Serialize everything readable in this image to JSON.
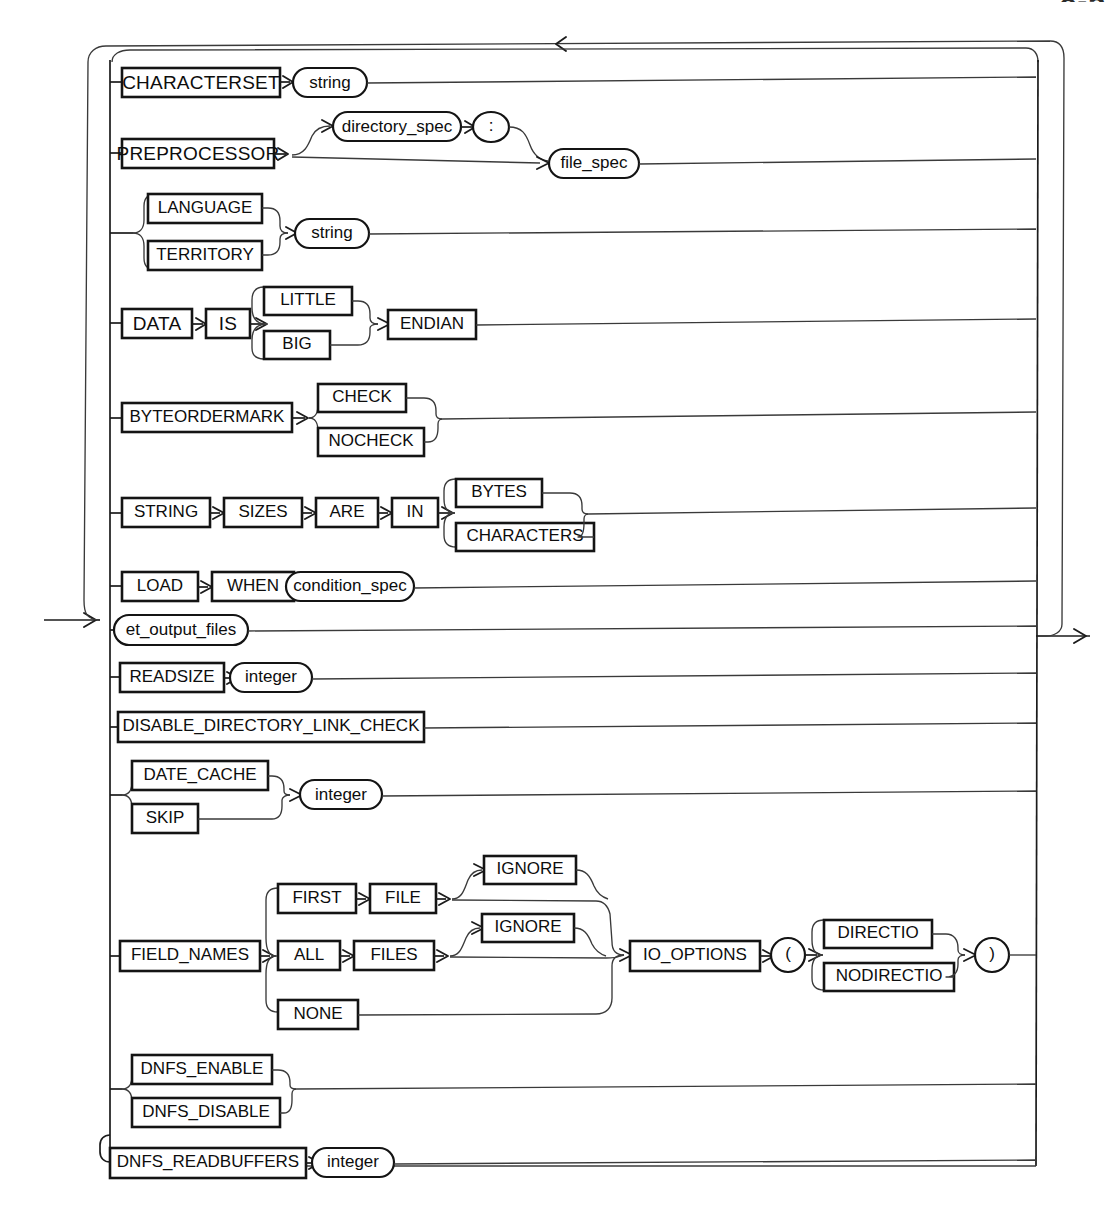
{
  "page": {
    "header_fragment": "8-5",
    "diagram_title": "et_record_spec_options",
    "kind": "railroad-syntax-diagram"
  },
  "symbols": {
    "entry_arrow": "arrow-right-icon",
    "exit_arrow": "arrow-right-icon",
    "loopback_arrow": "arrow-left-icon",
    "branch_arrow": "arrow-right-icon"
  },
  "branches": [
    {
      "id": "characterset",
      "label": "CHARACTERSET branch",
      "nodes": [
        {
          "text": "CHARACTERSET",
          "shape": "keyword"
        },
        {
          "text": "string",
          "shape": "nonterminal"
        }
      ]
    },
    {
      "id": "preprocessor",
      "label": "PREPROCESSOR branch",
      "nodes": [
        {
          "text": "PREPROCESSOR",
          "shape": "keyword"
        },
        {
          "text": "directory_spec",
          "shape": "nonterminal"
        },
        {
          "text": ":",
          "shape": "nonterminal"
        },
        {
          "text": "file_spec",
          "shape": "nonterminal"
        }
      ]
    },
    {
      "id": "language-territory",
      "label": "LANGUAGE / TERRITORY branch",
      "nodes": [
        {
          "text": "LANGUAGE",
          "shape": "keyword"
        },
        {
          "text": "TERRITORY",
          "shape": "keyword"
        },
        {
          "text": "string",
          "shape": "nonterminal"
        }
      ]
    },
    {
      "id": "data-is-endian",
      "label": "DATA IS ENDIAN branch",
      "nodes": [
        {
          "text": "DATA",
          "shape": "keyword"
        },
        {
          "text": "IS",
          "shape": "keyword"
        },
        {
          "text": "LITTLE",
          "shape": "keyword"
        },
        {
          "text": "BIG",
          "shape": "keyword"
        },
        {
          "text": "ENDIAN",
          "shape": "keyword"
        }
      ]
    },
    {
      "id": "byteordermark",
      "label": "BYTEORDERMARK branch",
      "nodes": [
        {
          "text": "BYTEORDERMARK",
          "shape": "keyword"
        },
        {
          "text": "CHECK",
          "shape": "keyword"
        },
        {
          "text": "NOCHECK",
          "shape": "keyword"
        }
      ]
    },
    {
      "id": "string-sizes",
      "label": "STRING SIZES ARE IN branch",
      "nodes": [
        {
          "text": "STRING",
          "shape": "keyword"
        },
        {
          "text": "SIZES",
          "shape": "keyword"
        },
        {
          "text": "ARE",
          "shape": "keyword"
        },
        {
          "text": "IN",
          "shape": "keyword"
        },
        {
          "text": "BYTES",
          "shape": "keyword"
        },
        {
          "text": "CHARACTERS",
          "shape": "keyword"
        }
      ]
    },
    {
      "id": "load-when",
      "label": "LOAD WHEN branch",
      "nodes": [
        {
          "text": "LOAD",
          "shape": "keyword"
        },
        {
          "text": "WHEN",
          "shape": "keyword"
        },
        {
          "text": "condition_spec",
          "shape": "nonterminal"
        }
      ]
    },
    {
      "id": "et-output-files",
      "label": "et_output_files branch",
      "nodes": [
        {
          "text": "et_output_files",
          "shape": "nonterminal"
        }
      ]
    },
    {
      "id": "readsize",
      "label": "READSIZE branch",
      "nodes": [
        {
          "text": "READSIZE",
          "shape": "keyword"
        },
        {
          "text": "integer",
          "shape": "nonterminal"
        }
      ]
    },
    {
      "id": "disable-directory-link-check",
      "label": "DISABLE_DIRECTORY_LINK_CHECK branch",
      "nodes": [
        {
          "text": "DISABLE_DIRECTORY_LINK_CHECK",
          "shape": "keyword"
        }
      ]
    },
    {
      "id": "date-cache-skip",
      "label": "DATE_CACHE / SKIP branch",
      "nodes": [
        {
          "text": "DATE_CACHE",
          "shape": "keyword"
        },
        {
          "text": "SKIP",
          "shape": "keyword"
        },
        {
          "text": "integer",
          "shape": "nonterminal"
        }
      ]
    },
    {
      "id": "field-names-io-options",
      "label": "FIELD_NAMES / IO_OPTIONS branch",
      "nodes": [
        {
          "text": "FIELD_NAMES",
          "shape": "keyword"
        },
        {
          "text": "FIRST",
          "shape": "keyword"
        },
        {
          "text": "FILE",
          "shape": "keyword"
        },
        {
          "text": "IGNORE",
          "shape": "keyword"
        },
        {
          "text": "ALL",
          "shape": "keyword"
        },
        {
          "text": "FILES",
          "shape": "keyword"
        },
        {
          "text": "IGNORE",
          "shape": "keyword"
        },
        {
          "text": "NONE",
          "shape": "keyword"
        },
        {
          "text": "IO_OPTIONS",
          "shape": "keyword"
        },
        {
          "text": "(",
          "shape": "nonterminal"
        },
        {
          "text": "DIRECTIO",
          "shape": "keyword"
        },
        {
          "text": "NODIRECTIO",
          "shape": "keyword"
        },
        {
          "text": ")",
          "shape": "nonterminal"
        }
      ]
    },
    {
      "id": "dnfs-enable-disable",
      "label": "DNFS_ENABLE / DNFS_DISABLE branch",
      "nodes": [
        {
          "text": "DNFS_ENABLE",
          "shape": "keyword"
        },
        {
          "text": "DNFS_DISABLE",
          "shape": "keyword"
        }
      ]
    },
    {
      "id": "dnfs-readbuffers",
      "label": "DNFS_READBUFFERS branch",
      "nodes": [
        {
          "text": "DNFS_READBUFFERS",
          "shape": "keyword"
        },
        {
          "text": "integer",
          "shape": "nonterminal"
        }
      ]
    }
  ],
  "labels": {
    "characterset": "CHARACTERSET",
    "string_1": "string",
    "preprocessor": "PREPROCESSOR",
    "directory_spec": "directory_spec",
    "colon": ":",
    "file_spec": "file_spec",
    "language": "LANGUAGE",
    "territory": "TERRITORY",
    "string_2": "string",
    "data": "DATA",
    "is": "IS",
    "little": "LITTLE",
    "big": "BIG",
    "endian": "ENDIAN",
    "byteordermark": "BYTEORDERMARK",
    "check": "CHECK",
    "nocheck": "NOCHECK",
    "string_kw": "STRING",
    "sizes": "SIZES",
    "are": "ARE",
    "in": "IN",
    "bytes": "BYTES",
    "characters": "CHARACTERS",
    "load": "LOAD",
    "when": "WHEN",
    "condition_spec": "condition_spec",
    "et_output_files": "et_output_files",
    "readsize": "READSIZE",
    "integer_1": "integer",
    "disable_directory_link_check": "DISABLE_DIRECTORY_LINK_CHECK",
    "date_cache": "DATE_CACHE",
    "skip": "SKIP",
    "integer_2": "integer",
    "field_names": "FIELD_NAMES",
    "first": "FIRST",
    "file": "FILE",
    "ignore_1": "IGNORE",
    "all": "ALL",
    "files": "FILES",
    "ignore_2": "IGNORE",
    "none": "NONE",
    "io_options": "IO_OPTIONS",
    "paren_open": "(",
    "directio": "DIRECTIO",
    "nodirectio": "NODIRECTIO",
    "paren_close": ")",
    "dnfs_enable": "DNFS_ENABLE",
    "dnfs_disable": "DNFS_DISABLE",
    "dnfs_readbuffers": "DNFS_READBUFFERS",
    "integer_3": "integer"
  },
  "colors": {
    "line": "#1b1b1b",
    "box_stroke": "#141414",
    "text": "#0d0d0d",
    "background": "#ffffff"
  }
}
